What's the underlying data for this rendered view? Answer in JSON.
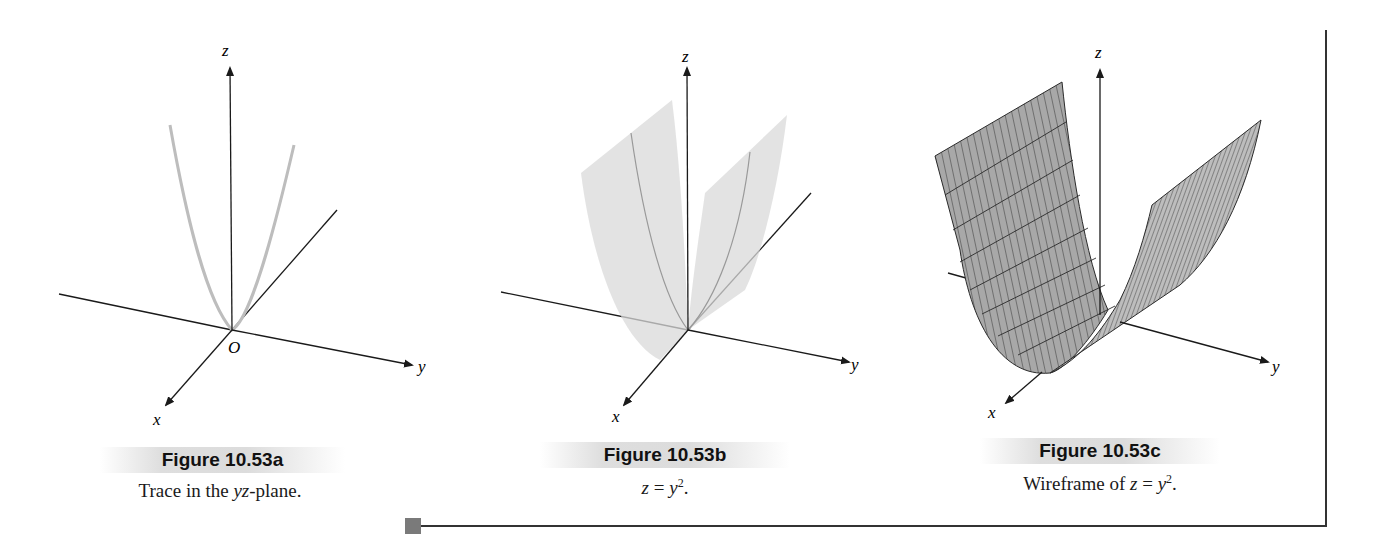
{
  "figures": [
    {
      "id": "a",
      "title": "Figure 10.53a",
      "caption_pre": "Trace in the ",
      "caption_italic": "yz",
      "caption_post": "-plane.",
      "axis_labels": {
        "x": "x",
        "y": "y",
        "z": "z",
        "origin": "O"
      },
      "description": "Parabola trace z = y^2 drawn in the yz-plane (gray curve)"
    },
    {
      "id": "b",
      "title": "Figure 10.53b",
      "caption_eq_lhs": "z",
      "caption_eq_op": " = ",
      "caption_eq_rhs": "y",
      "caption_eq_exp": "2",
      "caption_post": ".",
      "axis_labels": {
        "x": "x",
        "y": "y",
        "z": "z"
      },
      "description": "Translucent parabolic cylinder surface z = y^2"
    },
    {
      "id": "c",
      "title": "Figure 10.53c",
      "caption_pre": "Wireframe of ",
      "caption_eq_lhs": "z",
      "caption_eq_op": " = ",
      "caption_eq_rhs": "y",
      "caption_eq_exp": "2",
      "caption_post": ".",
      "axis_labels": {
        "x": "x",
        "y": "y",
        "z": "z"
      },
      "description": "Gray wireframe mesh of parabolic cylinder z = y^2"
    }
  ],
  "colors": {
    "axis": "#1a1a1a",
    "trace": "#bdbdbd",
    "surface_fill": "#d9d9d9",
    "wireframe_fill": "#a8a8a8",
    "wireframe_line": "#2a2a2a",
    "frame": "#333333",
    "marker": "#7a7a7a"
  }
}
